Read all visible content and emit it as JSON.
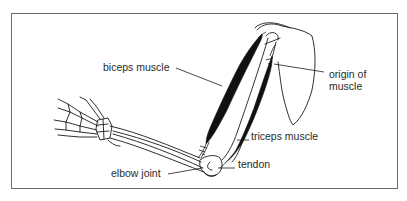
{
  "figure": {
    "labels": {
      "biceps": "biceps muscle",
      "origin_line1": "origin of",
      "origin_line2": "muscle",
      "triceps": "triceps muscle",
      "tendon": "tendon",
      "elbow": "elbow joint"
    },
    "colors": {
      "ink": "#1a1a1a",
      "muscle": "#111111",
      "frame": "#6a6a6a",
      "background": "#ffffff"
    }
  }
}
